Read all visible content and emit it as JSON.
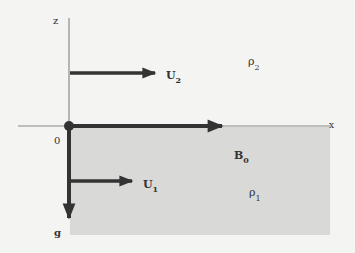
{
  "diagram": {
    "axes": {
      "z_label": "z",
      "x_label": "x",
      "origin_label": "0",
      "gravity_label": "g"
    },
    "upper_layer": {
      "velocity_label": "U",
      "velocity_sub": "2",
      "density_label": "ρ",
      "density_sub": "2"
    },
    "lower_layer": {
      "velocity_label": "U",
      "velocity_sub": "1",
      "density_label": "ρ",
      "density_sub": "1",
      "field_label": "B",
      "field_sub": "0",
      "fill_color": "#d9d9d7"
    },
    "colors": {
      "arrow": "#333333",
      "axis": "#777777",
      "background": "#f4f4f2"
    }
  }
}
